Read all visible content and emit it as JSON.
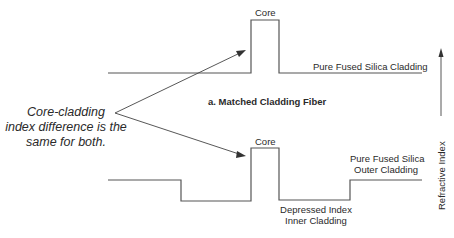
{
  "annotation": {
    "note_lines": [
      "Core-cladding",
      "index difference is the",
      "same for both."
    ]
  },
  "matched_fiber": {
    "title": "a. Matched Cladding Fiber",
    "core_label": "Core",
    "cladding_label": "Pure Fused Silica Cladding"
  },
  "depressed_fiber": {
    "core_label": "Core",
    "outer_cladding_lines": [
      "Pure Fused Silica",
      "Outer Cladding"
    ],
    "inner_cladding_lines": [
      "Depressed Index",
      "Inner Cladding"
    ]
  },
  "axis": {
    "label": "Refractive Index"
  },
  "colors": {
    "line": "#555555",
    "text": "#2a2a2a",
    "background": "#ffffff"
  }
}
